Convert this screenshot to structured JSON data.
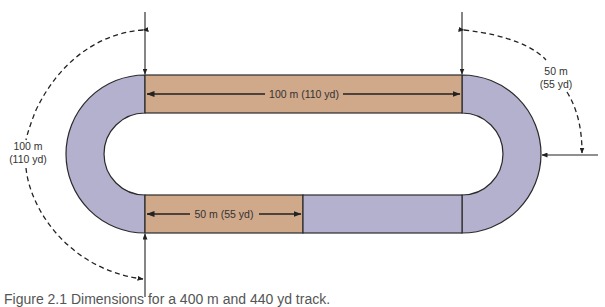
{
  "diagram": {
    "colors": {
      "straight_fill": "#d0a88a",
      "curve_fill": "#b3b1cd",
      "outline": "#2a2a2a",
      "arrow": "#222222",
      "label_text": "#333333"
    },
    "labels": {
      "top_straight": "100 m (110 yd)",
      "bottom_straight": "50 m (55 yd)",
      "left_curve_line1": "100 m",
      "left_curve_line2": "(110 yd)",
      "right_curve_line1": "50 m",
      "right_curve_line2": "(55 yd)"
    },
    "segments": [
      {
        "name": "top-straight",
        "length": "100 m (110 yd)",
        "color": "straight"
      },
      {
        "name": "left-curve",
        "length": "100 m (110 yd)",
        "color": "curve"
      },
      {
        "name": "bottom-straight-first-half",
        "length": "50 m (55 yd)",
        "color": "straight"
      },
      {
        "name": "bottom-straight-second-half",
        "color": "curve"
      },
      {
        "name": "right-curve",
        "color": "curve"
      }
    ]
  },
  "caption": {
    "text": "Figure 2.1  Dimensions for a 400 m and 440 yd track."
  }
}
